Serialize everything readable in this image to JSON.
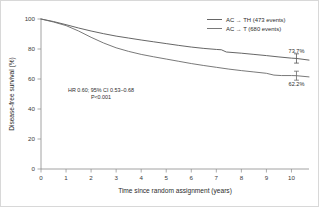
{
  "chart_data": {
    "type": "line",
    "title": "",
    "xlabel": "Time since random assignment (years)",
    "ylabel": "Disease-free survival (%)",
    "xlim": [
      0,
      10.7
    ],
    "ylim": [
      0,
      100
    ],
    "xticks": [
      "0",
      "1",
      "2",
      "3",
      "4",
      "5",
      "6",
      "7",
      "8",
      "9",
      "10"
    ],
    "yticks": [
      "0",
      "20",
      "40",
      "60",
      "80",
      "100"
    ],
    "grid": false,
    "legend_position": "top-right",
    "series": [
      {
        "name": "AC → TH (473 events)",
        "color": "#555555",
        "end_label": "73.7%",
        "end_value": 73.7,
        "x": [
          0,
          0.5,
          1,
          1.5,
          2,
          2.5,
          3,
          3.5,
          4,
          4.5,
          5,
          5.5,
          6,
          6.5,
          7,
          7.2,
          7.4,
          8,
          8.5,
          9,
          9.5,
          10,
          10.2,
          10.7
        ],
        "y": [
          100,
          98.3,
          96.2,
          94.0,
          92.0,
          90.2,
          88.6,
          87.3,
          86.0,
          84.8,
          83.6,
          82.4,
          81.3,
          80.4,
          79.7,
          79.5,
          78.0,
          77.2,
          76.4,
          75.6,
          74.7,
          73.9,
          73.7,
          72.6
        ]
      },
      {
        "name": "AC → T (680 events)",
        "color": "#6a6a6a",
        "end_label": "62.2%",
        "end_value": 62.2,
        "x": [
          0,
          0.5,
          1,
          1.5,
          2,
          2.5,
          3,
          3.5,
          4,
          4.5,
          5,
          5.5,
          6,
          6.5,
          7,
          7.5,
          8,
          8.5,
          9,
          9.3,
          9.6,
          10,
          10.2,
          10.7
        ],
        "y": [
          100,
          98.0,
          95.6,
          92.0,
          87.8,
          84.0,
          80.8,
          78.4,
          76.4,
          74.8,
          73.3,
          71.8,
          70.3,
          69.0,
          67.8,
          66.6,
          65.6,
          64.7,
          63.8,
          62.6,
          62.3,
          62.3,
          62.2,
          61.4
        ]
      }
    ],
    "annotations": [
      {
        "line1": "HR 0.60; 95% CI 0.53–0.68",
        "line2": "P<0.001"
      }
    ],
    "error_bars": [
      {
        "series": "AC → TH (473 events)",
        "x": 10.2,
        "y": 73.7,
        "lower": 70.6,
        "upper": 76.8
      },
      {
        "series": "AC → T (680 events)",
        "x": 10.2,
        "y": 62.2,
        "lower": 59.2,
        "upper": 65.2
      }
    ]
  }
}
